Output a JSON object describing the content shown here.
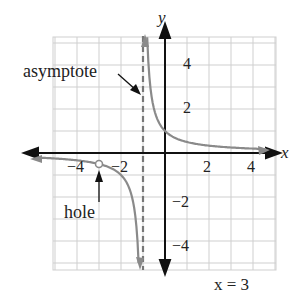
{
  "chart_data": {
    "type": "line",
    "title": "",
    "function": "y = 1/(x+1) with a hole at x = -3",
    "xlabel": "x",
    "ylabel": "y",
    "xlim": [
      -5,
      5
    ],
    "ylim": [
      -5,
      5
    ],
    "grid": true,
    "x_ticks": [
      -4,
      -2,
      2,
      4
    ],
    "y_ticks": [
      4,
      2,
      -2,
      -4
    ],
    "x_tick_labels": [
      "−4",
      "−2",
      "2",
      "4"
    ],
    "y_tick_labels": [
      "4",
      "2",
      "−2",
      "−4"
    ],
    "vertical_asymptote": -1,
    "hole": {
      "x": -3,
      "y": -0.5
    },
    "annotations": [
      {
        "text": "asymptote",
        "points_to": "vertical asymptote x = -1"
      },
      {
        "text": "hole",
        "points_to": "open circle at x = -3"
      }
    ],
    "caption": "x = 3",
    "colors": {
      "curve": "#8a8a8a",
      "axes": "#111111",
      "grid": "#cccccc",
      "asymptote": "#777777"
    }
  },
  "labels": {
    "x_axis": "x",
    "y_axis": "y",
    "asymptote": "asymptote",
    "hole": "hole",
    "caption": "x = 3",
    "xt_m4": "−4",
    "xt_m2": "−2",
    "xt_2": "2",
    "xt_4": "4",
    "yt_4": "4",
    "yt_2": "2",
    "yt_m2": "−2",
    "yt_m4": "−4"
  }
}
